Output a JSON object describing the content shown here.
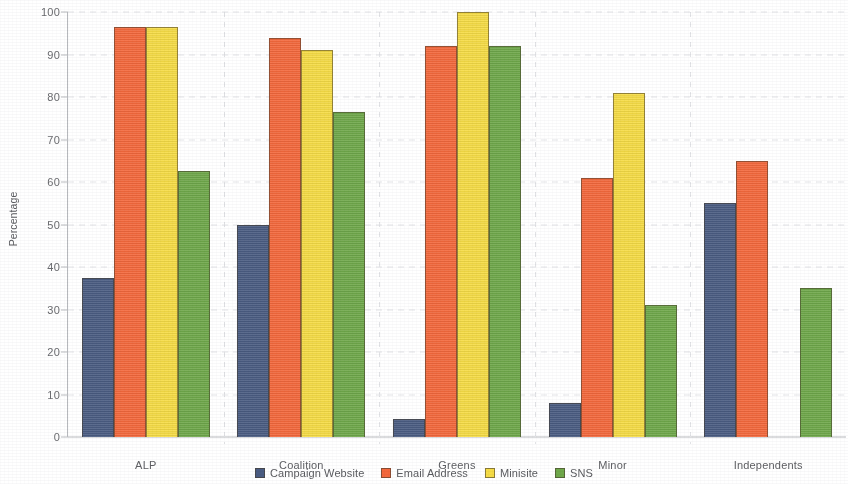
{
  "chart_data": {
    "type": "bar",
    "title": "",
    "xlabel": "",
    "ylabel": "Percentage",
    "ylim": [
      0,
      100
    ],
    "ytick_step": 10,
    "yticks": [
      100,
      90,
      80,
      70,
      60,
      50,
      40,
      30,
      20,
      10,
      0
    ],
    "grid": true,
    "legend_position": "bottom",
    "categories": [
      "ALP",
      "Coalition",
      "Greens",
      "Minor",
      "Independents"
    ],
    "series": [
      {
        "name": "Campaign Website",
        "color": "#4a5c82",
        "values": [
          37.5,
          50,
          4.2,
          8,
          55
        ]
      },
      {
        "name": "Email Address",
        "color": "#f4683c",
        "values": [
          96.5,
          94,
          92,
          61,
          65
        ]
      },
      {
        "name": "Minisite",
        "color": "#f6dc45",
        "values": [
          96.5,
          91,
          100,
          81,
          0
        ]
      },
      {
        "name": "SNS",
        "color": "#6fa84a",
        "values": [
          62.5,
          76.5,
          92,
          31,
          35
        ]
      }
    ]
  },
  "axis": {
    "y_title": "Percentage"
  }
}
